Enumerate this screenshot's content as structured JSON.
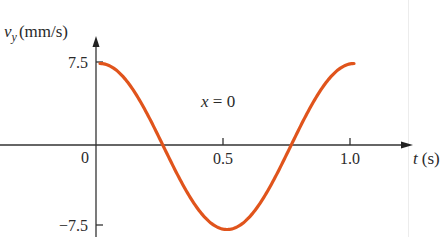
{
  "chart_data": {
    "type": "line",
    "title": "",
    "annotation": "x = 0",
    "xlabel": "t (s)",
    "ylabel": "v_y (mm/s)",
    "ylabel_symbol": "v",
    "ylabel_subscript": "y",
    "ylabel_units": "(mm/s)",
    "xlabel_symbol": "t",
    "xlabel_units": "(s)",
    "x_ticks": [
      "0",
      "0.5",
      "1.0"
    ],
    "y_ticks": [
      "7.5",
      "-7.5"
    ],
    "y_tick_labels_display": [
      "7.5",
      "−7.5"
    ],
    "xlim": [
      0,
      1.2
    ],
    "ylim": [
      -7.5,
      7.5
    ],
    "grid": false,
    "legend": null,
    "function": "v_y = 7.5 cos(2π t)",
    "series": [
      {
        "name": "v_y at x = 0",
        "color": "#e0541c",
        "x": [
          0,
          0.1,
          0.2,
          0.25,
          0.3,
          0.4,
          0.5,
          0.6,
          0.7,
          0.75,
          0.8,
          0.9,
          1.0
        ],
        "values": [
          7.5,
          6.07,
          2.32,
          0,
          -2.32,
          -6.07,
          -7.5,
          -6.07,
          -2.32,
          0,
          2.32,
          6.07,
          7.5
        ]
      }
    ]
  },
  "labels": {
    "y_axis_symbol": "v",
    "y_axis_subscript": "y",
    "y_axis_units": "(mm/s)",
    "x_axis_symbol": "t",
    "x_axis_units": "(s)",
    "origin": "0",
    "x_tick_0_5": "0.5",
    "x_tick_1_0": "1.0",
    "y_tick_top": "7.5",
    "y_tick_bottom": "−7.5",
    "annotation_var": "x",
    "annotation_rest": " = 0"
  },
  "colors": {
    "curve": "#e0541c",
    "axis": "#333333"
  }
}
